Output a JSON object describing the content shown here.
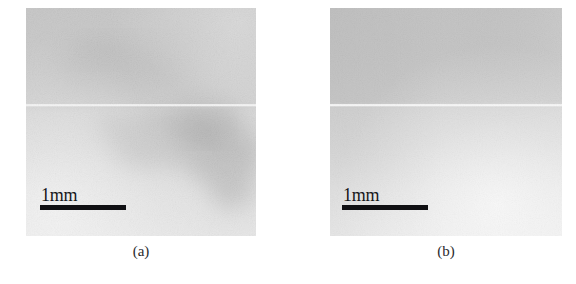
{
  "figure": {
    "background_color": "#ffffff",
    "width": 576,
    "height": 284,
    "panel_count": 2
  },
  "panels": [
    {
      "id": "a",
      "caption": "(a)",
      "scalebar": {
        "label": "1mm",
        "length_value": 1,
        "length_unit": "mm",
        "bar_color": "#101013",
        "text_color": "#17171a"
      },
      "image": {
        "kind": "grayscale-radiograph",
        "description": "Noisy grayscale radiographic image with a diffuse dark mottled region in the lower right-of-centre area and a bright horizontal scan-line artifact across the middle.",
        "base_gray": "#b4b4b4",
        "top_half_gray": "#a9a9a9",
        "bottom_half_gray": "#c6c6c6",
        "dark_blob_gray": "#8a8a8a",
        "seam_line_gray": "#e8e8e8",
        "seam_line_y_fraction": 0.43,
        "noise_amount": 0.34
      }
    },
    {
      "id": "b",
      "caption": "(b)",
      "scalebar": {
        "label": "1mm",
        "length_value": 1,
        "length_unit": "mm",
        "bar_color": "#101013",
        "text_color": "#17171a"
      },
      "image": {
        "kind": "grayscale-radiograph",
        "description": "Noisy grayscale radiographic image with an even mid-gray upper half, a bright horizontal scan-line artifact across the middle, and a smooth gradient brightening toward the lower right corner. No dark defect visible.",
        "base_gray": "#bcbcbc",
        "top_half_gray": "#a6a6a6",
        "bottom_half_gray": "#d2d2d2",
        "dark_blob_gray": "#ffffff",
        "seam_line_gray": "#efefef",
        "seam_line_y_fraction": 0.43,
        "noise_amount": 0.3
      }
    }
  ]
}
